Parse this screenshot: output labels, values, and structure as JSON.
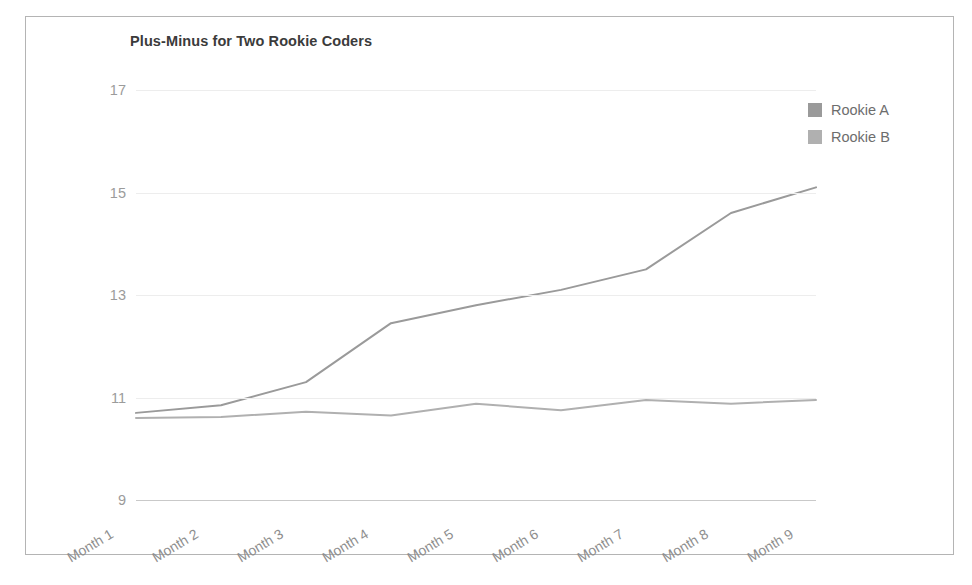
{
  "chart_data": {
    "type": "line",
    "title": "Plus-Minus for Two Rookie Coders",
    "xlabel": "",
    "ylabel": "",
    "categories": [
      "Month 1",
      "Month 2",
      "Month 3",
      "Month 4",
      "Month 5",
      "Month 6",
      "Month 7",
      "Month 8",
      "Month 9"
    ],
    "ylim": [
      9,
      17
    ],
    "yticks": [
      9,
      11,
      13,
      15,
      17
    ],
    "grid": true,
    "legend_position": "right-top",
    "series": [
      {
        "name": "Rookie A",
        "color": "#9a9a9a",
        "values": [
          10.7,
          10.85,
          11.3,
          12.45,
          12.8,
          13.1,
          13.5,
          14.6,
          15.1
        ]
      },
      {
        "name": "Rookie B",
        "color": "#b0b0b0",
        "values": [
          10.6,
          10.62,
          10.72,
          10.65,
          10.88,
          10.75,
          10.95,
          10.88,
          10.95
        ]
      }
    ]
  },
  "legend": {
    "items": [
      {
        "label": "Rookie A"
      },
      {
        "label": "Rookie B"
      }
    ]
  },
  "colors": {
    "series_a": "#9a9a9a",
    "series_b": "#b0b0b0",
    "gridline": "#ededed",
    "baseline": "#c9c9c9",
    "frame_border": "#b4b4b4",
    "title_text": "#3b3b3b",
    "tick_text": "#9b9b9b"
  }
}
